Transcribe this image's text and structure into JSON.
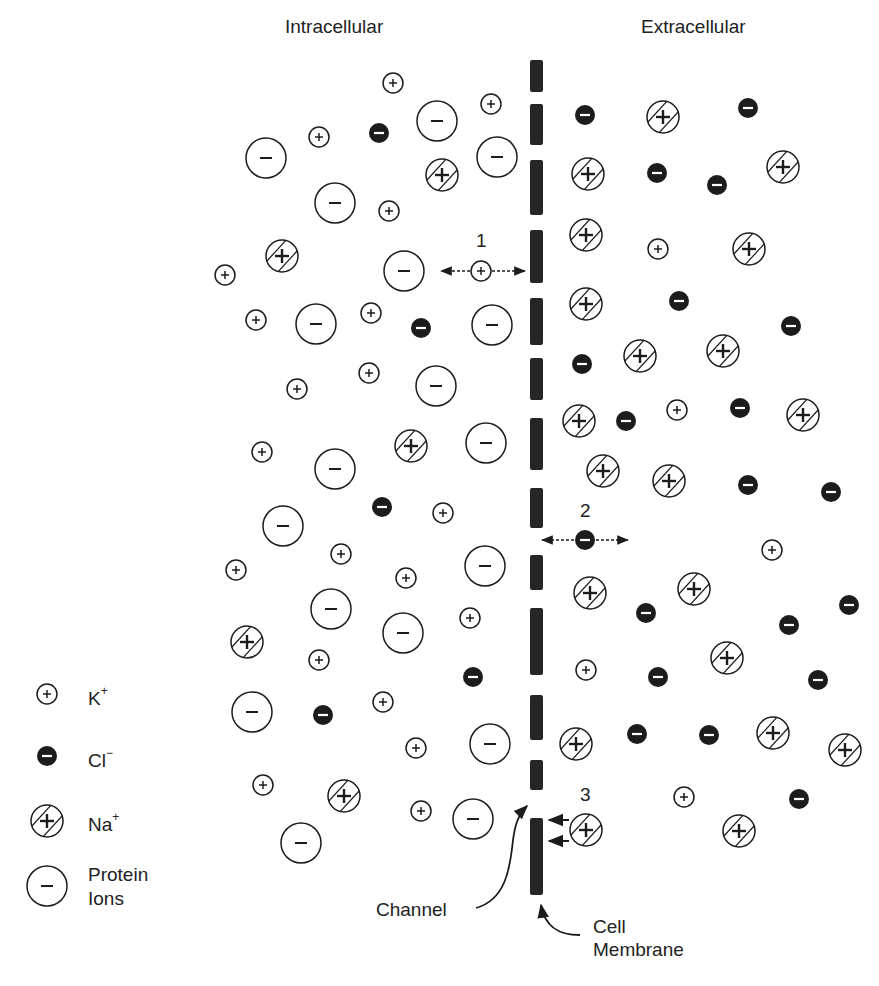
{
  "titles": {
    "intracellular": "Intracellular",
    "extracellular": "Extracellular"
  },
  "legend": [
    {
      "type": "K",
      "label": "K",
      "sup": "+"
    },
    {
      "type": "Cl",
      "label": "Cl",
      "sup": "−"
    },
    {
      "type": "Na",
      "label": "Na",
      "sup": "+"
    },
    {
      "type": "P",
      "label": "Protein",
      "label2": "Ions"
    }
  ],
  "annotations": {
    "path1": "1",
    "path2": "2",
    "path3": "3",
    "channel": "Channel",
    "membrane_line1": "Cell",
    "membrane_line2": "Membrane"
  },
  "colors": {
    "ink": "#1c1c1c",
    "membrane": "#262626",
    "background": "#ffffff"
  },
  "membrane": {
    "x": 530,
    "width": 13,
    "segments": [
      [
        60,
        92
      ],
      [
        104,
        145
      ],
      [
        160,
        215
      ],
      [
        230,
        283
      ],
      [
        298,
        345
      ],
      [
        358,
        400
      ],
      [
        418,
        470
      ],
      [
        488,
        528
      ],
      [
        555,
        590
      ],
      [
        608,
        675
      ],
      [
        695,
        740
      ],
      [
        760,
        790
      ],
      [
        818,
        895
      ]
    ]
  },
  "ions": {
    "intracellular": [
      {
        "t": "K",
        "x": 393,
        "y": 83
      },
      {
        "t": "K",
        "x": 491,
        "y": 104
      },
      {
        "t": "P",
        "x": 437,
        "y": 121
      },
      {
        "t": "K",
        "x": 319,
        "y": 137
      },
      {
        "t": "Cl",
        "x": 379,
        "y": 133
      },
      {
        "t": "P",
        "x": 266,
        "y": 158
      },
      {
        "t": "P",
        "x": 497,
        "y": 157
      },
      {
        "t": "Na",
        "x": 442,
        "y": 175
      },
      {
        "t": "P",
        "x": 335,
        "y": 203
      },
      {
        "t": "K",
        "x": 389,
        "y": 211
      },
      {
        "t": "Na",
        "x": 282,
        "y": 256
      },
      {
        "t": "K",
        "x": 225,
        "y": 275
      },
      {
        "t": "P",
        "x": 404,
        "y": 271
      },
      {
        "t": "K",
        "x": 256,
        "y": 320
      },
      {
        "t": "P",
        "x": 316,
        "y": 324
      },
      {
        "t": "K",
        "x": 371,
        "y": 313
      },
      {
        "t": "Cl",
        "x": 421,
        "y": 328
      },
      {
        "t": "P",
        "x": 492,
        "y": 325
      },
      {
        "t": "K",
        "x": 297,
        "y": 389
      },
      {
        "t": "K",
        "x": 369,
        "y": 373
      },
      {
        "t": "P",
        "x": 436,
        "y": 386
      },
      {
        "t": "K",
        "x": 262,
        "y": 452
      },
      {
        "t": "P",
        "x": 335,
        "y": 469
      },
      {
        "t": "Na",
        "x": 411,
        "y": 446
      },
      {
        "t": "P",
        "x": 486,
        "y": 443
      },
      {
        "t": "Cl",
        "x": 382,
        "y": 507
      },
      {
        "t": "K",
        "x": 443,
        "y": 513
      },
      {
        "t": "P",
        "x": 283,
        "y": 526
      },
      {
        "t": "K",
        "x": 236,
        "y": 570
      },
      {
        "t": "K",
        "x": 341,
        "y": 554
      },
      {
        "t": "K",
        "x": 406,
        "y": 578
      },
      {
        "t": "P",
        "x": 485,
        "y": 566
      },
      {
        "t": "P",
        "x": 331,
        "y": 609
      },
      {
        "t": "K",
        "x": 470,
        "y": 618
      },
      {
        "t": "P",
        "x": 403,
        "y": 633
      },
      {
        "t": "Na",
        "x": 247,
        "y": 642
      },
      {
        "t": "K",
        "x": 319,
        "y": 660
      },
      {
        "t": "Cl",
        "x": 473,
        "y": 677
      },
      {
        "t": "P",
        "x": 252,
        "y": 712
      },
      {
        "t": "Cl",
        "x": 323,
        "y": 715
      },
      {
        "t": "K",
        "x": 383,
        "y": 702
      },
      {
        "t": "K",
        "x": 416,
        "y": 748
      },
      {
        "t": "P",
        "x": 490,
        "y": 744
      },
      {
        "t": "K",
        "x": 263,
        "y": 785
      },
      {
        "t": "Na",
        "x": 344,
        "y": 796
      },
      {
        "t": "K",
        "x": 421,
        "y": 811
      },
      {
        "t": "P",
        "x": 473,
        "y": 819
      },
      {
        "t": "P",
        "x": 301,
        "y": 843
      }
    ],
    "extracellular": [
      {
        "t": "Cl",
        "x": 585,
        "y": 115
      },
      {
        "t": "Na",
        "x": 663,
        "y": 117
      },
      {
        "t": "Cl",
        "x": 748,
        "y": 108
      },
      {
        "t": "Na",
        "x": 588,
        "y": 174
      },
      {
        "t": "Cl",
        "x": 657,
        "y": 173
      },
      {
        "t": "Cl",
        "x": 717,
        "y": 185
      },
      {
        "t": "Na",
        "x": 783,
        "y": 167
      },
      {
        "t": "Na",
        "x": 586,
        "y": 235
      },
      {
        "t": "K",
        "x": 658,
        "y": 249
      },
      {
        "t": "Na",
        "x": 749,
        "y": 249
      },
      {
        "t": "Na",
        "x": 586,
        "y": 304
      },
      {
        "t": "Cl",
        "x": 679,
        "y": 301
      },
      {
        "t": "Cl",
        "x": 791,
        "y": 326
      },
      {
        "t": "Cl",
        "x": 582,
        "y": 364
      },
      {
        "t": "Na",
        "x": 640,
        "y": 356
      },
      {
        "t": "Na",
        "x": 723,
        "y": 351
      },
      {
        "t": "Na",
        "x": 579,
        "y": 421
      },
      {
        "t": "Cl",
        "x": 626,
        "y": 421
      },
      {
        "t": "K",
        "x": 677,
        "y": 410
      },
      {
        "t": "Cl",
        "x": 740,
        "y": 408
      },
      {
        "t": "Na",
        "x": 803,
        "y": 415
      },
      {
        "t": "Na",
        "x": 603,
        "y": 471
      },
      {
        "t": "Na",
        "x": 669,
        "y": 481
      },
      {
        "t": "Cl",
        "x": 748,
        "y": 485
      },
      {
        "t": "Cl",
        "x": 831,
        "y": 492
      },
      {
        "t": "K",
        "x": 772,
        "y": 550
      },
      {
        "t": "Na",
        "x": 590,
        "y": 593
      },
      {
        "t": "Cl",
        "x": 646,
        "y": 613
      },
      {
        "t": "Na",
        "x": 694,
        "y": 589
      },
      {
        "t": "Cl",
        "x": 789,
        "y": 625
      },
      {
        "t": "Cl",
        "x": 849,
        "y": 605
      },
      {
        "t": "K",
        "x": 586,
        "y": 670
      },
      {
        "t": "Cl",
        "x": 658,
        "y": 677
      },
      {
        "t": "Na",
        "x": 727,
        "y": 658
      },
      {
        "t": "Cl",
        "x": 818,
        "y": 680
      },
      {
        "t": "Na",
        "x": 576,
        "y": 744
      },
      {
        "t": "Cl",
        "x": 637,
        "y": 734
      },
      {
        "t": "Cl",
        "x": 709,
        "y": 735
      },
      {
        "t": "Na",
        "x": 773,
        "y": 733
      },
      {
        "t": "Na",
        "x": 845,
        "y": 750
      },
      {
        "t": "K",
        "x": 684,
        "y": 797
      },
      {
        "t": "Cl",
        "x": 799,
        "y": 799
      },
      {
        "t": "Na",
        "x": 739,
        "y": 831
      }
    ],
    "moving": [
      {
        "t": "K",
        "x": 481,
        "y": 271,
        "id": "path1-ion"
      },
      {
        "t": "Cl",
        "x": 585,
        "y": 540,
        "id": "path2-ion"
      },
      {
        "t": "Na",
        "x": 586,
        "y": 830,
        "id": "path3-ion"
      }
    ]
  },
  "legend_positions": [
    {
      "x": 47,
      "y": 694
    },
    {
      "x": 47,
      "y": 756
    },
    {
      "x": 47,
      "y": 821
    },
    {
      "x": 47,
      "y": 886
    }
  ]
}
